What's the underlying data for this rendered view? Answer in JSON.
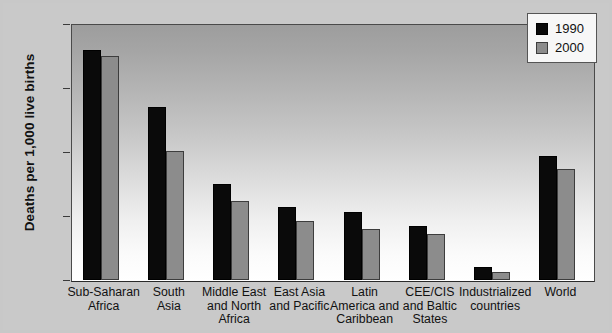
{
  "chart_data": {
    "type": "bar",
    "title": "",
    "xlabel": "",
    "ylabel": "Deaths per 1,000 live births",
    "ylim": [
      0,
      200
    ],
    "yticks": [
      0,
      50,
      100,
      150,
      200
    ],
    "ytick_labels": [
      "0",
      "50",
      "100",
      "150",
      "200"
    ],
    "grid": false,
    "legend_position": "top-right",
    "categories": [
      "Sub-Saharan Africa",
      "South Asia",
      "Middle East and North Africa",
      "East Asia and Pacific",
      "Latin America and Caribbean",
      "CEE/CIS and Baltic States",
      "Industrialized countries",
      "World"
    ],
    "category_lines": [
      [
        "Sub-Saharan",
        "Africa"
      ],
      [
        "South",
        "Asia"
      ],
      [
        "Middle East",
        "and North",
        "Africa"
      ],
      [
        "East Asia",
        "and Pacific"
      ],
      [
        "Latin",
        "America and",
        "Caribbean"
      ],
      [
        "CEE/CIS",
        "and Baltic",
        "States"
      ],
      [
        "Industrialized",
        "countries"
      ],
      [
        "World"
      ]
    ],
    "series": [
      {
        "name": "1990",
        "color": "#0a0a0a",
        "values": [
          180,
          135,
          75,
          57,
          53,
          42,
          10,
          97
        ]
      },
      {
        "name": "2000",
        "color": "#8c8c8c",
        "values": [
          175,
          101,
          62,
          46,
          40,
          36,
          6,
          87
        ]
      }
    ]
  },
  "legend": {
    "items": [
      {
        "label": "1990"
      },
      {
        "label": "2000"
      }
    ]
  }
}
